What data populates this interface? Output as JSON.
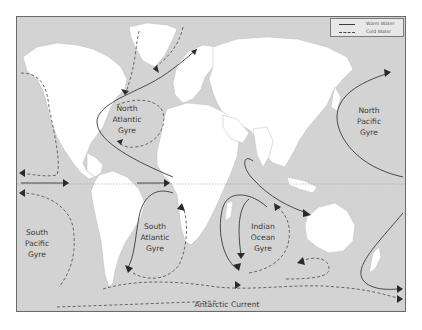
{
  "map": {
    "title": "",
    "legend": {
      "items": [
        {
          "label": "Warm Water",
          "style": "solid"
        },
        {
          "label": "Cold Water",
          "style": "dashed"
        }
      ]
    },
    "gyres": [
      {
        "name": "north_atlantic",
        "lines": [
          "North",
          "Atlantic",
          "Gyre"
        ]
      },
      {
        "name": "north_pacific",
        "lines": [
          "North",
          "Pacific",
          "Gyre"
        ]
      },
      {
        "name": "south_pacific",
        "lines": [
          "South",
          "Pacific",
          "Gyre"
        ]
      },
      {
        "name": "south_atlantic",
        "lines": [
          "South",
          "Atlantic",
          "Gyre"
        ]
      },
      {
        "name": "indian_ocean",
        "lines": [
          "Indian",
          "Ocean",
          "Gyre"
        ]
      }
    ],
    "currents": {
      "antarctic": "Antarctic Current"
    },
    "colors": {
      "ocean": "#d3d3d3",
      "land": "#ffffff",
      "warm_line": "#3a3a3a",
      "cold_line": "#4a4a4a",
      "frame": "#6a6a6a"
    }
  }
}
